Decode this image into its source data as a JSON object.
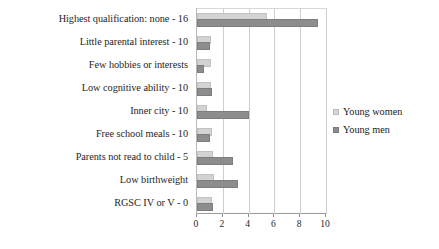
{
  "chart_data": {
    "type": "bar",
    "orientation": "horizontal",
    "title": "",
    "xlabel": "",
    "ylabel": "",
    "xlim": [
      0,
      10
    ],
    "xticks": [
      0,
      2,
      4,
      6,
      8,
      10
    ],
    "xtick_labels": [
      "0",
      "2",
      "4",
      "6",
      "8",
      "10"
    ],
    "grid": true,
    "grid_axis": "x",
    "legend_position": "right",
    "categories": [
      "Highest qualification: none - 16",
      "Little parental interest - 10",
      "Few hobbies or interests",
      "Low cognitive ability - 10",
      "Inner city  - 10",
      "Free school meals - 10",
      "Parents not read to child - 5",
      "Low birthweight",
      "RGSC IV or V - 0"
    ],
    "series": [
      {
        "name": "Young women",
        "color": "#d3d3d3",
        "values": [
          5.3,
          0.9,
          0.9,
          0.9,
          0.6,
          1.0,
          1.1,
          1.2,
          1.0
        ]
      },
      {
        "name": "Young men",
        "color": "#8d8d8d",
        "values": [
          9.2,
          0.85,
          0.35,
          1.0,
          3.9,
          0.85,
          2.6,
          3.0,
          1.1
        ]
      }
    ]
  },
  "legend": {
    "items": [
      {
        "label": "Young women",
        "marker": "square-light"
      },
      {
        "label": "Young men",
        "marker": "square-dark"
      }
    ]
  }
}
